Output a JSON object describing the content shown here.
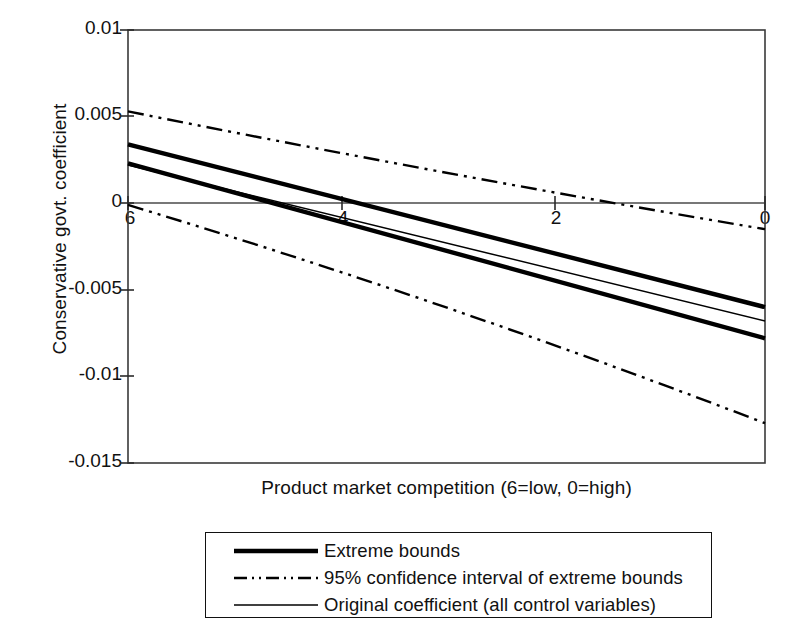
{
  "chart_data": {
    "type": "line",
    "title": "",
    "xlabel": "Product market competition (6=low, 0=high)",
    "ylabel": "Conservative govt. coefficient",
    "xlim": [
      6,
      0
    ],
    "ylim": [
      -0.015,
      0.01
    ],
    "x_axis_reversed": true,
    "grid": false,
    "legend_position": "below-plot",
    "x_ticks": [
      6,
      4,
      2,
      0
    ],
    "x_tick_labels": [
      "6",
      "4",
      "2",
      "0"
    ],
    "y_ticks": [
      0.01,
      0.005,
      0,
      -0.005,
      -0.01,
      -0.015
    ],
    "y_tick_labels": [
      "0.01",
      "0.005",
      "0",
      "-0.005",
      "-0.01",
      "-0.015"
    ],
    "zero_line": 0,
    "x": [
      6,
      0
    ],
    "series": [
      {
        "name": "Upper extreme bound",
        "legend": "Extreme bounds",
        "style": "solid-thick",
        "color": "#000000",
        "values": [
          0.0034,
          -0.006
        ]
      },
      {
        "name": "Lower extreme bound",
        "legend": "Extreme bounds",
        "style": "solid-thick",
        "color": "#000000",
        "values": [
          0.0023,
          -0.0078
        ]
      },
      {
        "name": "Original coefficient (all control variables)",
        "legend": "Original coefficient (all control variables)",
        "style": "solid-thin",
        "color": "#000000",
        "values": [
          0.0022,
          -0.0068
        ]
      },
      {
        "name": "Upper 95% confidence interval of extreme bounds",
        "legend": "95% confidence interval of extreme bounds",
        "style": "dash-dot-dot",
        "color": "#000000",
        "values": [
          0.0053,
          -0.0015
        ]
      },
      {
        "name": "Lower 95% confidence interval of extreme bounds",
        "legend": "95% confidence interval of extreme bounds",
        "style": "dash-dot-dot",
        "color": "#000000",
        "values": [
          -0.0001,
          -0.0127
        ]
      }
    ],
    "legend_entries": [
      {
        "label": "Extreme bounds",
        "style": "solid-thick"
      },
      {
        "label": "95% confidence interval of extreme bounds",
        "style": "dash-dot-dot"
      },
      {
        "label": "Original coefficient (all control variables)",
        "style": "solid-thin"
      }
    ]
  }
}
